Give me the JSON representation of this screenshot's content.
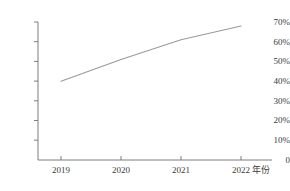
{
  "chart_data": {
    "type": "line",
    "title": "",
    "xlabel": "年份",
    "ylabel": "",
    "categories": [
      "2019",
      "2020",
      "2021",
      "2022"
    ],
    "x": [
      2019,
      2020,
      2021,
      2022
    ],
    "values": [
      40,
      51,
      61,
      68
    ],
    "series": [
      {
        "name": "",
        "values": [
          40,
          51,
          61,
          68
        ]
      }
    ],
    "ylim": [
      0,
      70
    ],
    "ytick_labels": [
      "0",
      "10%",
      "20%",
      "30%",
      "40%",
      "50%",
      "60%",
      "70%"
    ],
    "ytick_values": [
      0,
      10,
      20,
      30,
      40,
      50,
      60,
      70
    ],
    "xtick_labels": [
      "2019",
      "2020",
      "2021",
      "2022"
    ],
    "grid": false,
    "legend": "none",
    "line_color": "#9a9a9a",
    "axis_color": "#808080",
    "text_color": "#3a3a3a"
  },
  "axis": {
    "y_labels": [
      {
        "text": "70%",
        "top": 17
      },
      {
        "text": "60%",
        "top": 37
      },
      {
        "text": "50%",
        "top": 56
      },
      {
        "text": "40%",
        "top": 76
      },
      {
        "text": "30%",
        "top": 95
      },
      {
        "text": "20%",
        "top": 115
      },
      {
        "text": "10%",
        "top": 134
      },
      {
        "text": "0",
        "top": 154
      }
    ],
    "x_labels": [
      {
        "text": "2019",
        "left": 41
      },
      {
        "text": "2020",
        "left": 101
      },
      {
        "text": "2021",
        "left": 161
      },
      {
        "text": "2022",
        "left": 221
      }
    ],
    "x_title": "年份"
  }
}
